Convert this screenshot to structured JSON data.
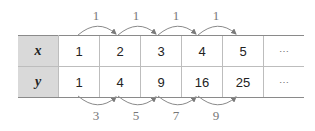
{
  "table": {
    "rows": [
      {
        "header": "x",
        "values": [
          "1",
          "2",
          "3",
          "4",
          "5",
          "⋯"
        ]
      },
      {
        "header": "y",
        "values": [
          "1",
          "4",
          "9",
          "16",
          "25",
          "⋯"
        ]
      }
    ]
  },
  "top_differences": [
    "1",
    "1",
    "1",
    "1"
  ],
  "bottom_differences": [
    "3",
    "5",
    "7",
    "9"
  ],
  "colors": {
    "header_bg": "#d9d9d9",
    "arrow": "#8a8a8a",
    "label": "#777777"
  }
}
